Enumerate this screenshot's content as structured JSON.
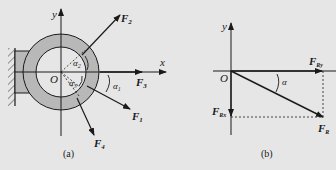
{
  "figure_a": {
    "caption": "(a)",
    "axes": {
      "x": "x",
      "y": "y",
      "origin": "O"
    },
    "forces": [
      {
        "name": "F",
        "sub": "1"
      },
      {
        "name": "F",
        "sub": "2"
      },
      {
        "name": "F",
        "sub": "3"
      },
      {
        "name": "F",
        "sub": "4"
      }
    ],
    "angles": [
      {
        "name": "α",
        "sub": "1"
      },
      {
        "name": "α",
        "sub": "2"
      },
      {
        "name": "α",
        "sub": "3"
      }
    ]
  },
  "figure_b": {
    "caption": "(b)",
    "axes": {
      "y": "y",
      "origin": "O"
    },
    "forces": [
      {
        "name": "F",
        "sub": "Ry"
      },
      {
        "name": "F",
        "sub": "Rx"
      },
      {
        "name": "F",
        "sub": "R"
      }
    ],
    "angle": "α"
  },
  "colors": {
    "background": "#e6e6e6",
    "ring": "#b8b8b8",
    "line": "#1a1a1a"
  }
}
